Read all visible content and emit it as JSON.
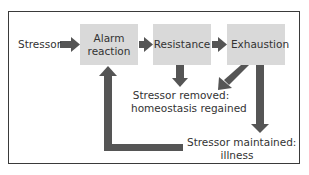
{
  "diagram": {
    "nodes": {
      "stressor": "Stressor",
      "alarm": "Alarm reaction",
      "alarm_line1": "Alarm",
      "alarm_line2": "reaction",
      "resistance": "Resistance",
      "exhaustion": "Exhaustion",
      "removed_line1": "Stressor removed:",
      "removed_line2": "homeostasis regained",
      "maintained_line1": "Stressor maintained:",
      "maintained_line2": "illness"
    },
    "edges": [
      {
        "from": "Stressor",
        "to": "Alarm reaction"
      },
      {
        "from": "Alarm reaction",
        "to": "Resistance"
      },
      {
        "from": "Resistance",
        "to": "Exhaustion"
      },
      {
        "from": "Resistance",
        "to": "Stressor removed: homeostasis regained"
      },
      {
        "from": "Exhaustion",
        "to": "Stressor removed: homeostasis regained"
      },
      {
        "from": "Exhaustion",
        "to": "Stressor maintained: illness"
      },
      {
        "from": "Stressor maintained: illness",
        "to": "Alarm reaction"
      }
    ],
    "colors": {
      "box_fill": "#d9d9d9",
      "arrow": "#555555",
      "border": "#3a3a3a",
      "text": "#333333"
    }
  }
}
